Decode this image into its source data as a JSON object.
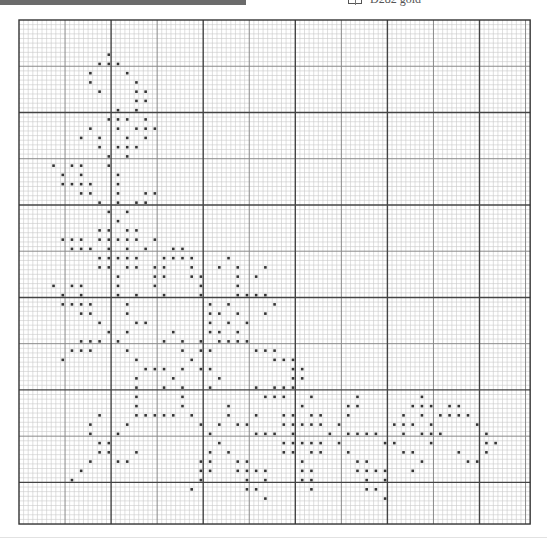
{
  "legend": {
    "symbol": "square-outline-icon",
    "label": "D282 gold"
  },
  "colors": {
    "top_bar": "#6b6b6b",
    "stitch": "#333333",
    "grid_minor": "#c9c9c9",
    "grid_medium": "#8a8a8a",
    "grid_major": "#444444",
    "border": "#333333"
  },
  "chart_data": {
    "type": "heatmap",
    "title": "",
    "grid": {
      "cols": 111,
      "rows": 109,
      "origin_px": [
        19,
        20
      ],
      "cell_px": [
        4.605,
        4.624
      ],
      "minor_every": 1,
      "medium_every": 10,
      "medium_offset": 10,
      "major_every": 20
    },
    "legend": [
      {
        "symbol": "filled-square",
        "label": "D282 gold"
      }
    ],
    "stitches_by_row": {
      "7": [
        19
      ],
      "9": [
        17,
        19,
        21
      ],
      "11": [
        15,
        23
      ],
      "13": [
        15,
        25
      ],
      "15": [
        17,
        25,
        27
      ],
      "17": [
        25,
        27
      ],
      "19": [
        21,
        25
      ],
      "21": [
        19,
        21,
        23,
        27
      ],
      "23": [
        15,
        21,
        25,
        27,
        29
      ],
      "25": [
        13,
        17,
        23,
        27
      ],
      "27": [
        17,
        21,
        23,
        25
      ],
      "29": [
        19,
        23
      ],
      "31": [
        7,
        11,
        13,
        19
      ],
      "33": [
        9,
        13,
        21
      ],
      "35": [
        9,
        11,
        13,
        15,
        21
      ],
      "37": [
        13,
        15,
        21,
        27,
        29
      ],
      "39": [
        17,
        21,
        25,
        27
      ],
      "41": [
        19,
        23
      ],
      "43": [
        21
      ],
      "45": [
        17,
        19,
        23,
        25
      ],
      "47": [
        9,
        11,
        13,
        17,
        19,
        21,
        23,
        25,
        29
      ],
      "49": [
        11,
        13,
        15,
        19,
        23,
        27,
        33,
        35
      ],
      "51": [
        17,
        19,
        21,
        23,
        25,
        31,
        33,
        35,
        37,
        45
      ],
      "53": [
        17,
        19,
        23,
        25,
        29,
        31,
        37,
        43,
        47,
        53
      ],
      "55": [
        21,
        29,
        31,
        37,
        39,
        47,
        51
      ],
      "57": [
        7,
        11,
        13,
        21,
        29,
        39,
        47
      ],
      "59": [
        9,
        13,
        21,
        25,
        31,
        39,
        47,
        49,
        51,
        53
      ],
      "61": [
        9,
        11,
        13,
        15,
        23,
        41,
        45,
        55
      ],
      "63": [
        13,
        15,
        23,
        41,
        43,
        47,
        53
      ],
      "65": [
        17,
        25,
        27,
        41,
        45,
        49
      ],
      "67": [
        19,
        23,
        33,
        41,
        43,
        47
      ],
      "69": [
        13,
        15,
        17,
        21,
        31,
        35,
        39,
        43,
        45,
        47,
        49
      ],
      "71": [
        11,
        13,
        15,
        23,
        35,
        39,
        41,
        51,
        53,
        55
      ],
      "73": [
        9,
        25,
        37,
        55,
        57,
        59
      ],
      "75": [
        27,
        29,
        31,
        35,
        39,
        41,
        59,
        61
      ],
      "77": [
        25,
        33,
        43,
        59,
        61
      ],
      "79": [
        25,
        31,
        35,
        41,
        51,
        55,
        57,
        59
      ],
      "81": [
        25,
        35,
        53,
        55,
        57,
        63,
        73,
        87
      ],
      "83": [
        25,
        35,
        45,
        61,
        71,
        73,
        85,
        87,
        89,
        93,
        95
      ],
      "85": [
        17,
        25,
        27,
        29,
        31,
        33,
        37,
        45,
        51,
        57,
        59,
        63,
        65,
        71,
        83,
        87,
        91,
        93,
        95,
        97
      ],
      "87": [
        15,
        23,
        39,
        43,
        47,
        49,
        57,
        59,
        61,
        63,
        65,
        69,
        81,
        83,
        85,
        89,
        99
      ],
      "89": [
        15,
        21,
        41,
        51,
        53,
        55,
        59,
        67,
        71,
        73,
        75,
        77,
        83,
        87,
        89,
        91,
        101
      ],
      "91": [
        17,
        19,
        43,
        57,
        59,
        61,
        63,
        65,
        69,
        79,
        81,
        89,
        101,
        103
      ],
      "93": [
        17,
        19,
        25,
        41,
        45,
        57,
        59,
        63,
        65,
        71,
        83,
        85,
        95,
        101
      ],
      "95": [
        15,
        21,
        23,
        39,
        41,
        47,
        49,
        61,
        73,
        75,
        87,
        97,
        99
      ],
      "97": [
        13,
        39,
        41,
        47,
        49,
        51,
        53,
        61,
        63,
        73,
        75,
        77,
        79,
        85
      ],
      "99": [
        11,
        39,
        49,
        53,
        61,
        63,
        75,
        79
      ],
      "101": [
        37,
        49,
        51,
        63,
        75,
        77
      ],
      "103": [
        53,
        79
      ]
    }
  }
}
